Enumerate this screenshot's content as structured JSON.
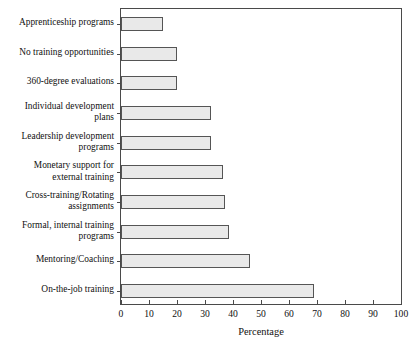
{
  "chart_data": {
    "type": "bar",
    "orientation": "horizontal",
    "title": "",
    "xlabel": "Percentage",
    "ylabel": "",
    "xlim": [
      0,
      100
    ],
    "xticks": [
      0,
      10,
      20,
      30,
      40,
      50,
      60,
      70,
      80,
      90,
      100
    ],
    "grid": false,
    "legend": false,
    "bar_fill_color": "#e9e9e9",
    "bar_border_color": "#555555",
    "frame_color": "#4a4a4a",
    "categories": [
      "Apprenticeship programs",
      "No training opportunities",
      "360-degree evaluations",
      "Individual development\nplans",
      "Leadership development\nprograms",
      "Monetary support for\nexternal training",
      "Cross-training/Rotating\nassignments",
      "Formal, internal training\nprograms",
      "Mentoring/Coaching",
      "On-the-job training"
    ],
    "values": [
      15,
      20,
      20,
      32,
      32,
      36.5,
      37,
      38.5,
      46,
      69
    ]
  }
}
